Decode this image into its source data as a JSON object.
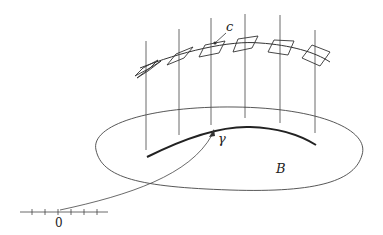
{
  "diagram": {
    "title": "",
    "labels": {
      "fiber_point": "c",
      "curve": "γ",
      "base": "B",
      "origin": "0"
    },
    "colors": {
      "stroke": "#333333",
      "background": "#ffffff"
    },
    "fibers_count": 6,
    "parallelograms_count": 6,
    "axis_ticks": 7
  }
}
